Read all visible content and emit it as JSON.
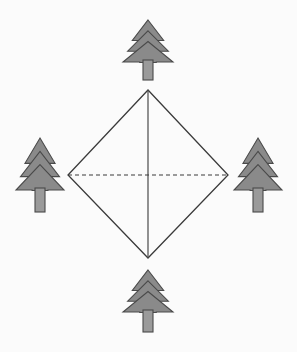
{
  "figure": {
    "background_color": "#fbfbfb",
    "canvas": {
      "width": 297,
      "height": 352
    }
  },
  "diagram": {
    "name": "diamond-with-trees",
    "shape": {
      "label": "diamond",
      "type": "quadrilateral",
      "stroke_color": "#3a3a3a",
      "fill_color": "none",
      "stroke_width": 1.3,
      "vertices": [
        {
          "name": "top-vertex",
          "x": 148,
          "y": 90
        },
        {
          "name": "right-vertex",
          "x": 228,
          "y": 175
        },
        {
          "name": "bottom-vertex",
          "x": 148,
          "y": 258
        },
        {
          "name": "left-vertex",
          "x": 68,
          "y": 175
        }
      ]
    },
    "diagonals": [
      {
        "name": "vertical-diagonal",
        "style": "solid",
        "stroke_color": "#4a4a4a",
        "stroke_width": 1.2,
        "x1": 148,
        "y1": 90,
        "x2": 148,
        "y2": 258
      },
      {
        "name": "horizontal-diagonal",
        "style": "dashed",
        "dash_pattern": "4,3",
        "stroke_color": "#3a3a3a",
        "stroke_width": 1.2,
        "x1": 68,
        "y1": 175,
        "x2": 228,
        "y2": 175
      }
    ],
    "trees": [
      {
        "name": "tree-north",
        "position_label": "top",
        "center_x": 148,
        "foliage_top_y": 20,
        "foliage_bottom_y": 62,
        "half_width": 25,
        "trunk_width": 10,
        "trunk_bottom_y": 80
      },
      {
        "name": "tree-west",
        "position_label": "left",
        "center_x": 40,
        "foliage_top_y": 138,
        "foliage_bottom_y": 190,
        "half_width": 24,
        "trunk_width": 10,
        "trunk_bottom_y": 212
      },
      {
        "name": "tree-east",
        "position_label": "right",
        "center_x": 258,
        "foliage_top_y": 138,
        "foliage_bottom_y": 190,
        "half_width": 24,
        "trunk_width": 10,
        "trunk_bottom_y": 212
      },
      {
        "name": "tree-south",
        "position_label": "bottom",
        "center_x": 148,
        "foliage_top_y": 270,
        "foliage_bottom_y": 312,
        "half_width": 25,
        "trunk_width": 10,
        "trunk_bottom_y": 332
      }
    ],
    "tree_style": {
      "foliage_fill": "#8a8a8a",
      "foliage_stroke": "#4a4a4a",
      "trunk_fill": "#9a9a9a",
      "trunk_stroke": "#4a4a4a",
      "stroke_width": 1.1,
      "tier_count": 3
    }
  }
}
